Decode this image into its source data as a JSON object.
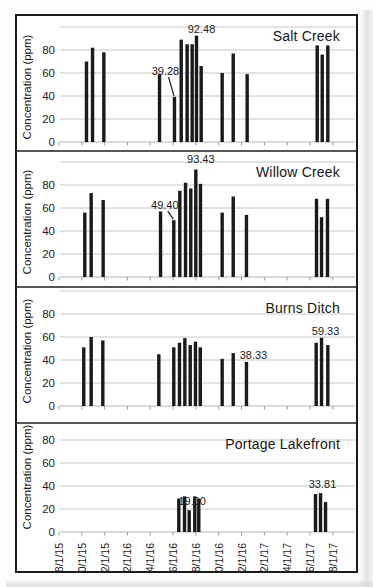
{
  "figure": {
    "colors": {
      "bar": "#1a1a1a",
      "grid": "#c6c6c6",
      "axis": "#b5b5b5",
      "border": "#1c1c1c",
      "text": "#1a1a1a"
    }
  },
  "x_axis": {
    "tick_interval_months": 2,
    "tick_labels": [
      "8/1/15",
      "10/1/15",
      "12/1/15",
      "2/1/16",
      "4/1/16",
      "6/1/16",
      "8/1/16",
      "10/1/16",
      "12/1/16",
      "2/1/17",
      "4/1/17",
      "6/1/17",
      "8/1/17"
    ]
  },
  "y_axis": {
    "label": "Concentration (ppm)",
    "ticks": [
      0,
      20,
      40,
      60,
      80
    ]
  },
  "chart_data": [
    {
      "type": "bar",
      "title": "Salt Creek",
      "ylabel": "Concentration (ppm)",
      "xlabel": "",
      "ylim": [
        0,
        100
      ],
      "yticks": [
        0,
        20,
        40,
        60,
        80
      ],
      "x_unit": "months since 8/1/15",
      "bars": [
        {
          "t": 2.41,
          "v": 70
        },
        {
          "t": 2.94,
          "v": 82
        },
        {
          "t": 3.93,
          "v": 78
        },
        {
          "t": 8.81,
          "v": 59
        },
        {
          "t": 10.12,
          "v": 39.28
        },
        {
          "t": 10.71,
          "v": 89
        },
        {
          "t": 11.23,
          "v": 85
        },
        {
          "t": 11.67,
          "v": 85
        },
        {
          "t": 12.05,
          "v": 92.48
        },
        {
          "t": 12.46,
          "v": 66
        },
        {
          "t": 14.3,
          "v": 60
        },
        {
          "t": 15.27,
          "v": 77
        },
        {
          "t": 16.49,
          "v": 59
        },
        {
          "t": 22.63,
          "v": 84
        },
        {
          "t": 23.07,
          "v": 76
        },
        {
          "t": 23.56,
          "v": 84
        }
      ],
      "annotations": [
        {
          "label": "92.48",
          "t": 12.05,
          "dx": 5,
          "dy": 0
        },
        {
          "label": "39.28",
          "t": 10.12,
          "leader": true,
          "dx": -9,
          "dy": -19
        }
      ]
    },
    {
      "type": "bar",
      "title": "Willow Creek",
      "ylabel": "Concentration (ppm)",
      "xlabel": "",
      "ylim": [
        0,
        100
      ],
      "yticks": [
        0,
        20,
        40,
        60,
        80
      ],
      "x_unit": "months since 8/1/15",
      "bars": [
        {
          "t": 2.26,
          "v": 56
        },
        {
          "t": 2.82,
          "v": 73
        },
        {
          "t": 3.87,
          "v": 67
        },
        {
          "t": 8.9,
          "v": 57
        },
        {
          "t": 10.06,
          "v": 49.4
        },
        {
          "t": 10.59,
          "v": 75
        },
        {
          "t": 11.09,
          "v": 82
        },
        {
          "t": 11.55,
          "v": 77
        },
        {
          "t": 11.99,
          "v": 93.43
        },
        {
          "t": 12.4,
          "v": 81
        },
        {
          "t": 14.3,
          "v": 56
        },
        {
          "t": 15.27,
          "v": 70
        },
        {
          "t": 16.43,
          "v": 54
        },
        {
          "t": 22.57,
          "v": 68
        },
        {
          "t": 23.01,
          "v": 52
        },
        {
          "t": 23.53,
          "v": 68
        }
      ],
      "annotations": [
        {
          "label": "93.43",
          "t": 11.99,
          "dx": 5,
          "dy": -4
        },
        {
          "label": "49.40",
          "t": 10.06,
          "leader": true,
          "dx": -9,
          "dy": -8
        }
      ]
    },
    {
      "type": "bar",
      "title": "Burns Ditch",
      "ylabel": "Concentration (ppm)",
      "xlabel": "",
      "ylim": [
        0,
        100
      ],
      "yticks": [
        0,
        20,
        40,
        60,
        80
      ],
      "x_unit": "months since 8/1/15",
      "bars": [
        {
          "t": 2.17,
          "v": 51
        },
        {
          "t": 2.82,
          "v": 60
        },
        {
          "t": 3.84,
          "v": 57
        },
        {
          "t": 8.75,
          "v": 45
        },
        {
          "t": 10.06,
          "v": 51
        },
        {
          "t": 10.56,
          "v": 55
        },
        {
          "t": 11.03,
          "v": 59
        },
        {
          "t": 11.5,
          "v": 53
        },
        {
          "t": 11.96,
          "v": 56
        },
        {
          "t": 12.38,
          "v": 51
        },
        {
          "t": 14.3,
          "v": 41
        },
        {
          "t": 15.27,
          "v": 46
        },
        {
          "t": 16.43,
          "v": 38.33
        },
        {
          "t": 22.54,
          "v": 55
        },
        {
          "t": 23.01,
          "v": 59.33
        },
        {
          "t": 23.56,
          "v": 53
        }
      ],
      "annotations": [
        {
          "label": "38.33",
          "t": 16.43,
          "dx": 7,
          "dy": 0
        },
        {
          "label": "59.33",
          "t": 23.01,
          "dx": 4,
          "dy": 0
        }
      ]
    },
    {
      "type": "bar",
      "title": "Portage Lakefront",
      "ylabel": "Concentration (ppm)",
      "xlabel": "",
      "ylim": [
        0,
        100
      ],
      "yticks": [
        0,
        20,
        40,
        60,
        80
      ],
      "x_unit": "months since 8/1/15",
      "bars": [
        {
          "t": 10.5,
          "v": 29
        },
        {
          "t": 11.0,
          "v": 31
        },
        {
          "t": 11.41,
          "v": 19.0
        },
        {
          "t": 11.9,
          "v": 31
        },
        {
          "t": 12.25,
          "v": 29
        },
        {
          "t": 22.48,
          "v": 33
        },
        {
          "t": 22.92,
          "v": 33.81
        },
        {
          "t": 23.36,
          "v": 26
        }
      ],
      "annotations": [
        {
          "label": "19.00",
          "t": 11.41,
          "dx": 3,
          "dy": -2
        },
        {
          "label": "33.81",
          "t": 22.92,
          "dx": 2,
          "dy": -2
        }
      ]
    }
  ]
}
